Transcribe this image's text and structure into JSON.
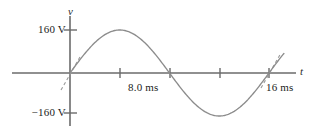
{
  "figure": {
    "name": "ac-voltage-sine-waveform",
    "background_color": "#ffffff",
    "axis_color": "#6b6b6b",
    "curve_color": "#8c8c8c",
    "text_color": "#1c1c1c"
  },
  "axes": {
    "vertical_label": "v",
    "horizontal_label": "t",
    "y_ticks": [
      {
        "label": "160 V",
        "value": 160
      },
      {
        "label": "−160 V",
        "value": -160
      }
    ],
    "x_ticks": [
      {
        "label": "",
        "value": 4
      },
      {
        "label": "8.0 ms",
        "value": 8
      },
      {
        "label": "",
        "value": 12
      },
      {
        "label": "16 ms",
        "value": 16
      }
    ]
  },
  "chart_data": {
    "type": "line",
    "title": "",
    "xlabel": "t",
    "ylabel": "v",
    "xunits": "ms",
    "yunits": "V",
    "xlim": [
      -1.2,
      18.5
    ],
    "ylim": [
      -200,
      200
    ],
    "grid": false,
    "legend": null,
    "annotations": [
      {
        "name": "tangent-at-origin",
        "type": "dashed-line",
        "x": 0,
        "y": 0,
        "slope_direction": "up-right"
      },
      {
        "name": "tangent-at-16ms",
        "type": "dashed-line",
        "x": 16,
        "y": 0,
        "slope_direction": "up-right"
      }
    ],
    "series": [
      {
        "name": "v(t)",
        "form": "sine",
        "amplitude": 160,
        "period": 16,
        "phase": 0,
        "x": [
          0,
          1,
          2,
          3,
          4,
          5,
          6,
          7,
          8,
          9,
          10,
          11,
          12,
          13,
          14,
          15,
          16,
          17
        ],
        "values": [
          0,
          61.2,
          113.1,
          147.8,
          160,
          147.8,
          113.1,
          61.2,
          0,
          -61.2,
          -113.1,
          -147.8,
          -160,
          -147.8,
          -113.1,
          -61.2,
          0,
          61.2
        ]
      }
    ]
  }
}
